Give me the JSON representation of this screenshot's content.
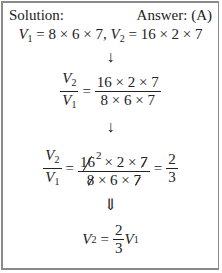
{
  "header": {
    "left_label": "Solution:",
    "right_label": "Answer: (A)"
  },
  "given": {
    "v1_symbol": "V",
    "v1_sub": "1",
    "v1_expr": " = 8 × 6 × 7, ",
    "v2_symbol": "V",
    "v2_sub": "2",
    "v2_expr": " = 16 × 2 × 7"
  },
  "arrows": {
    "down": "↓",
    "double_down": "⇓"
  },
  "ratio": {
    "num_symbol": "V",
    "num_sub": "2",
    "den_symbol": "V",
    "den_sub": "1",
    "equals": "=",
    "frac_num": "16 × 2 × 7",
    "frac_den": "8 × 6 × 7"
  },
  "cancel": {
    "num_struck_1": "16",
    "num_sup": "2",
    "num_mid": "× 2 ×",
    "num_struck_2": "7",
    "den_struck_1": "8",
    "den_mid": "× 6 ×",
    "den_struck_2": "7",
    "result_num": "2",
    "result_den": "3"
  },
  "final": {
    "lhs_symbol": "V",
    "lhs_sub": "2",
    "equals": "=",
    "coef_num": "2",
    "coef_den": "3",
    "rhs_symbol": "V",
    "rhs_sub": "1"
  }
}
